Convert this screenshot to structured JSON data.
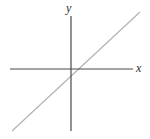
{
  "figure": {
    "width": 150,
    "height": 139,
    "background_color": "#ffffff"
  },
  "labels": {
    "y_axis": "y",
    "x_axis": "x"
  },
  "colors": {
    "axis": "#4a4a4a",
    "line": "#b0b0b0",
    "label_text": "#2b2b2b",
    "background": "#ffffff"
  },
  "chart_data": {
    "type": "line",
    "title": "",
    "subtitle": "",
    "xlabel": "x",
    "ylabel": "y",
    "grid": false,
    "legend": null,
    "annotations": [],
    "tick_labels": {
      "x": [],
      "y": []
    },
    "axes": {
      "x_axis_pixel_y": 69,
      "y_axis_pixel_x": 71,
      "x_axis_pixel_span": [
        10,
        133
      ],
      "y_axis_pixel_span": [
        16,
        131
      ],
      "origin_pixel": [
        71,
        69
      ]
    },
    "series": [
      {
        "name": "line",
        "description": "straight line with positive slope passing just right of the origin",
        "slope": 0.93,
        "y_intercept": -0.06,
        "x_intercept": 0.07,
        "pixel_points": [
          [
            12,
            131
          ],
          [
            35,
            110
          ],
          [
            71,
            74
          ],
          [
            78,
            69
          ],
          [
            127,
            24
          ],
          [
            140,
            12
          ]
        ],
        "x": [
          -3,
          -2,
          -1,
          0,
          1,
          2,
          3
        ],
        "values": [
          -2.85,
          -1.92,
          -0.99,
          -0.06,
          0.87,
          1.8,
          2.73
        ]
      }
    ],
    "xlim": [
      -3.3,
      3.4
    ],
    "ylim": [
      -3.0,
      3.1
    ]
  }
}
